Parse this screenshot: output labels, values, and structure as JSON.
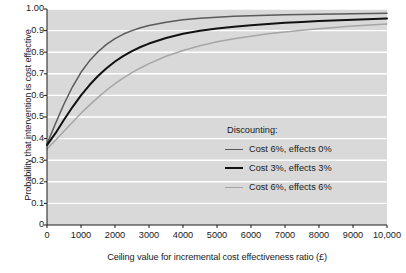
{
  "chart_data": {
    "type": "line",
    "title": "",
    "xlabel": "Ceiling value for incremental cost effectiveness ratio (£)",
    "ylabel": "Probability that intervention is cost effective",
    "xlim": [
      0,
      10000
    ],
    "ylim": [
      0,
      1.0
    ],
    "grid": "horizontal",
    "plot_background": "#d9d9d9",
    "gridline_color": "#ffffff",
    "legend_position": "inside lower right",
    "xticks": [
      0,
      1000,
      2000,
      3000,
      4000,
      5000,
      6000,
      7000,
      8000,
      9000,
      10000
    ],
    "xticklabels": [
      "0",
      "1000",
      "2000",
      "3000",
      "4000",
      "5000",
      "6000",
      "7000",
      "8000",
      "9000",
      "10,000"
    ],
    "yticks": [
      0,
      0.1,
      0.2,
      0.3,
      0.4,
      0.5,
      0.6,
      0.7,
      0.8,
      0.9,
      1.0
    ],
    "yticklabels": [
      "0",
      "0.1",
      "0.2",
      "0.3",
      "0.4",
      "0.5",
      "0.6",
      "0.7",
      "0.8",
      "0.9",
      "1.00"
    ],
    "legend_title": "Discounting:",
    "x": [
      0,
      250,
      500,
      750,
      1000,
      1250,
      1500,
      1750,
      2000,
      2250,
      2500,
      2750,
      3000,
      3500,
      4000,
      4500,
      5000,
      5500,
      6000,
      6500,
      7000,
      7500,
      8000,
      9000,
      10000
    ],
    "series": [
      {
        "name": "Cost 6%, effects 0%",
        "color": "#5a5a5a",
        "width": 1.5,
        "values": [
          0.375,
          0.47,
          0.56,
          0.64,
          0.707,
          0.76,
          0.802,
          0.836,
          0.863,
          0.884,
          0.9,
          0.913,
          0.924,
          0.939,
          0.95,
          0.957,
          0.962,
          0.966,
          0.969,
          0.971,
          0.973,
          0.975,
          0.976,
          0.978,
          0.98
        ]
      },
      {
        "name": "Cost 3%, effects 3%",
        "color": "#121212",
        "width": 2.0,
        "values": [
          0.37,
          0.425,
          0.487,
          0.546,
          0.6,
          0.648,
          0.69,
          0.726,
          0.757,
          0.783,
          0.805,
          0.824,
          0.84,
          0.866,
          0.885,
          0.899,
          0.91,
          0.918,
          0.925,
          0.931,
          0.936,
          0.94,
          0.944,
          0.95,
          0.956
        ]
      },
      {
        "name": "Cost 6%, effects 6%",
        "color": "#a6a6a6",
        "width": 1.5,
        "values": [
          0.352,
          0.392,
          0.434,
          0.476,
          0.517,
          0.555,
          0.591,
          0.624,
          0.654,
          0.681,
          0.705,
          0.727,
          0.747,
          0.781,
          0.808,
          0.83,
          0.848,
          0.862,
          0.874,
          0.885,
          0.894,
          0.902,
          0.909,
          0.921,
          0.931
        ]
      }
    ]
  }
}
